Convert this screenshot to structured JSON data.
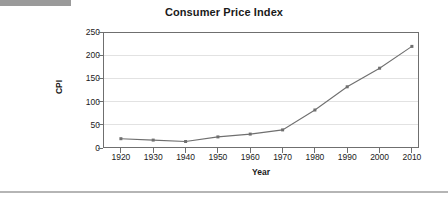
{
  "chart_data": {
    "type": "line",
    "title": "Consumer Price Index",
    "xlabel": "Year",
    "ylabel": "CPI",
    "x": [
      1920,
      1930,
      1940,
      1950,
      1960,
      1970,
      1980,
      1990,
      2000,
      2010
    ],
    "values": [
      20,
      17,
      14,
      24,
      30,
      39,
      82,
      132,
      172,
      219
    ],
    "categories": [
      "1920",
      "1930",
      "1940",
      "1950",
      "1960",
      "1970",
      "1980",
      "1990",
      "2000",
      "2010"
    ],
    "xlim": [
      1920,
      2010
    ],
    "ylim": [
      0,
      250
    ],
    "yticks": [
      0,
      50,
      100,
      150,
      200,
      250
    ],
    "ytick_labels": [
      "0",
      "50",
      "100",
      "150",
      "200",
      "250"
    ],
    "xticks": [
      1920,
      1930,
      1940,
      1950,
      1960,
      1970,
      1980,
      1990,
      2000,
      2010
    ],
    "xtick_labels": [
      "1920",
      "1930",
      "1940",
      "1950",
      "1960",
      "1970",
      "1980",
      "1990",
      "2000",
      "2010"
    ],
    "grid": "horizontal",
    "legend": null,
    "series": [
      {
        "name": "CPI",
        "color": "#6f6f6f",
        "marker": "square",
        "values": [
          20,
          17,
          14,
          24,
          30,
          39,
          82,
          132,
          172,
          219
        ]
      }
    ]
  },
  "colors": {
    "line": "#6f6f6f",
    "axis": "#6f6f6f",
    "grid": "#e2e2e2",
    "text": "#1a1a1a",
    "top_bar": "#9a9a9a",
    "rule": "#b5b5b5"
  },
  "decor": {
    "top_bar_label": "header-bar",
    "bottom_rule_label": "footer-rule"
  }
}
